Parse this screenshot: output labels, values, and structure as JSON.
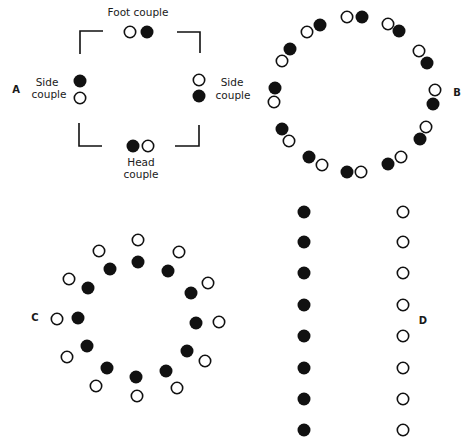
{
  "colors": {
    "ink": "#111111",
    "paper": "#ffffff"
  },
  "dot_radius": 6.5,
  "panels": {
    "A": {
      "letter": "A",
      "letter_pos": [
        16,
        89
      ],
      "labels": {
        "foot": "Foot couple",
        "side_left_1": "Side",
        "side_left_2": "couple",
        "side_right_1": "Side",
        "side_right_2": "couple",
        "head_1": "Head",
        "head_2": "couple"
      },
      "dots": [
        {
          "x": 130,
          "y": 32,
          "fill": "open"
        },
        {
          "x": 147,
          "y": 32,
          "fill": "filled"
        },
        {
          "x": 80,
          "y": 81,
          "fill": "filled"
        },
        {
          "x": 80,
          "y": 98,
          "fill": "open"
        },
        {
          "x": 199,
          "y": 80,
          "fill": "open"
        },
        {
          "x": 199,
          "y": 96,
          "fill": "filled"
        },
        {
          "x": 133,
          "y": 146,
          "fill": "filled"
        },
        {
          "x": 148,
          "y": 146,
          "fill": "open"
        }
      ],
      "brackets": [
        "M103,31 L80,31 L80,54",
        "M177,32 L200,32 L200,53",
        "M79,123 L79,146 L102,146",
        "M199,125 L199,146 L175,146"
      ]
    },
    "B": {
      "letter": "B",
      "letter_pos": [
        457,
        92
      ],
      "dots": [
        {
          "x": 347,
          "y": 17,
          "fill": "open"
        },
        {
          "x": 362,
          "y": 17,
          "fill": "filled"
        },
        {
          "x": 388,
          "y": 24,
          "fill": "open"
        },
        {
          "x": 399,
          "y": 31,
          "fill": "filled"
        },
        {
          "x": 419,
          "y": 51,
          "fill": "open"
        },
        {
          "x": 427,
          "y": 63,
          "fill": "filled"
        },
        {
          "x": 435,
          "y": 90,
          "fill": "open"
        },
        {
          "x": 433,
          "y": 104,
          "fill": "filled"
        },
        {
          "x": 426,
          "y": 127,
          "fill": "open"
        },
        {
          "x": 420,
          "y": 139,
          "fill": "filled"
        },
        {
          "x": 401,
          "y": 157,
          "fill": "open"
        },
        {
          "x": 388,
          "y": 164,
          "fill": "filled"
        },
        {
          "x": 361,
          "y": 172,
          "fill": "open"
        },
        {
          "x": 347,
          "y": 172,
          "fill": "filled"
        },
        {
          "x": 309,
          "y": 157,
          "fill": "filled"
        },
        {
          "x": 322,
          "y": 165,
          "fill": "open"
        },
        {
          "x": 282,
          "y": 129,
          "fill": "filled"
        },
        {
          "x": 289,
          "y": 141,
          "fill": "open"
        },
        {
          "x": 275,
          "y": 88,
          "fill": "filled"
        },
        {
          "x": 274,
          "y": 102,
          "fill": "open"
        },
        {
          "x": 290,
          "y": 49,
          "fill": "filled"
        },
        {
          "x": 282,
          "y": 61,
          "fill": "open"
        },
        {
          "x": 320,
          "y": 25,
          "fill": "filled"
        },
        {
          "x": 307,
          "y": 32,
          "fill": "open"
        }
      ]
    },
    "C": {
      "letter": "C",
      "letter_pos": [
        35,
        317
      ],
      "dots": [
        {
          "x": 138,
          "y": 240,
          "fill": "open"
        },
        {
          "x": 179,
          "y": 252,
          "fill": "open"
        },
        {
          "x": 208,
          "y": 283,
          "fill": "open"
        },
        {
          "x": 219,
          "y": 322,
          "fill": "open"
        },
        {
          "x": 205,
          "y": 361,
          "fill": "open"
        },
        {
          "x": 177,
          "y": 388,
          "fill": "open"
        },
        {
          "x": 137,
          "y": 396,
          "fill": "open"
        },
        {
          "x": 96,
          "y": 386,
          "fill": "open"
        },
        {
          "x": 67,
          "y": 357,
          "fill": "open"
        },
        {
          "x": 57,
          "y": 319,
          "fill": "open"
        },
        {
          "x": 69,
          "y": 279,
          "fill": "open"
        },
        {
          "x": 99,
          "y": 251,
          "fill": "open"
        },
        {
          "x": 138,
          "y": 262,
          "fill": "filled"
        },
        {
          "x": 168,
          "y": 271,
          "fill": "filled"
        },
        {
          "x": 191,
          "y": 293,
          "fill": "filled"
        },
        {
          "x": 196,
          "y": 323,
          "fill": "filled"
        },
        {
          "x": 187,
          "y": 351,
          "fill": "filled"
        },
        {
          "x": 166,
          "y": 371,
          "fill": "filled"
        },
        {
          "x": 136,
          "y": 377,
          "fill": "filled"
        },
        {
          "x": 107,
          "y": 368,
          "fill": "filled"
        },
        {
          "x": 87,
          "y": 346,
          "fill": "filled"
        },
        {
          "x": 78,
          "y": 318,
          "fill": "filled"
        },
        {
          "x": 88,
          "y": 288,
          "fill": "filled"
        },
        {
          "x": 110,
          "y": 269,
          "fill": "filled"
        }
      ]
    },
    "D": {
      "letter": "D",
      "letter_pos": [
        423,
        320
      ],
      "dots": [
        {
          "x": 304,
          "y": 212,
          "fill": "filled"
        },
        {
          "x": 304,
          "y": 242,
          "fill": "filled"
        },
        {
          "x": 304,
          "y": 273,
          "fill": "filled"
        },
        {
          "x": 304,
          "y": 305,
          "fill": "filled"
        },
        {
          "x": 304,
          "y": 336,
          "fill": "filled"
        },
        {
          "x": 304,
          "y": 368,
          "fill": "filled"
        },
        {
          "x": 304,
          "y": 399,
          "fill": "filled"
        },
        {
          "x": 304,
          "y": 430,
          "fill": "filled"
        },
        {
          "x": 403,
          "y": 212,
          "fill": "open"
        },
        {
          "x": 403,
          "y": 242,
          "fill": "open"
        },
        {
          "x": 403,
          "y": 273,
          "fill": "open"
        },
        {
          "x": 403,
          "y": 305,
          "fill": "open"
        },
        {
          "x": 403,
          "y": 336,
          "fill": "open"
        },
        {
          "x": 403,
          "y": 368,
          "fill": "open"
        },
        {
          "x": 403,
          "y": 399,
          "fill": "open"
        },
        {
          "x": 403,
          "y": 430,
          "fill": "open"
        }
      ]
    }
  }
}
